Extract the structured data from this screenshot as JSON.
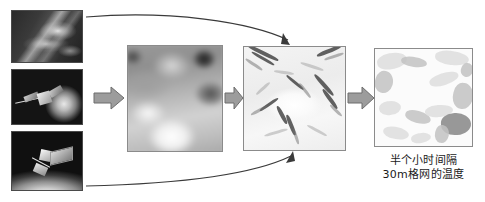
{
  "figure": {
    "type": "workflow-diagram",
    "topic": "remote sensing thermal downscaling workflow",
    "background_color": "#ffffff"
  },
  "sources": {
    "label": "satellite data sources",
    "items": [
      {
        "id": "cloud",
        "name": "cloud-storm-photo",
        "alt": "grayscale cloud and storm imagery"
      },
      {
        "id": "sat_globe",
        "name": "satellite-globe-photo",
        "alt": "satellite in orbit beside the globe"
      },
      {
        "id": "sat_limb",
        "name": "satellite-earth-limb-photo",
        "alt": "satellite above the curved edge of Earth"
      }
    ]
  },
  "panels": [
    {
      "id": "coarse",
      "name": "coarse-resolution-raster",
      "alt": "blurry coarse grayscale thermal raster"
    },
    {
      "id": "fine",
      "name": "fine-resolution-raster",
      "alt": "high resolution terrain texture raster"
    },
    {
      "id": "output",
      "name": "downscaled-output-raster",
      "alt": "smoothed downscaled temperature raster"
    }
  ],
  "arrows": {
    "block": [
      {
        "id": "a1",
        "name": "arrow-sources-to-coarse"
      },
      {
        "id": "a2",
        "name": "arrow-coarse-to-fine"
      },
      {
        "id": "a3",
        "name": "arrow-fine-to-output"
      }
    ],
    "curved": [
      {
        "id": "c1",
        "name": "curve-top-source-to-fine",
        "color": "#3a3a3a"
      },
      {
        "id": "c2",
        "name": "curve-bottom-source-to-fine",
        "color": "#3a3a3a"
      }
    ],
    "fill": "#9c9c9c",
    "stroke": "#6d6d6d"
  },
  "caption": {
    "name": "output-caption",
    "line1": "半个小时间隔",
    "line2": "30m格网的温度",
    "color": "#1a1a1a"
  }
}
